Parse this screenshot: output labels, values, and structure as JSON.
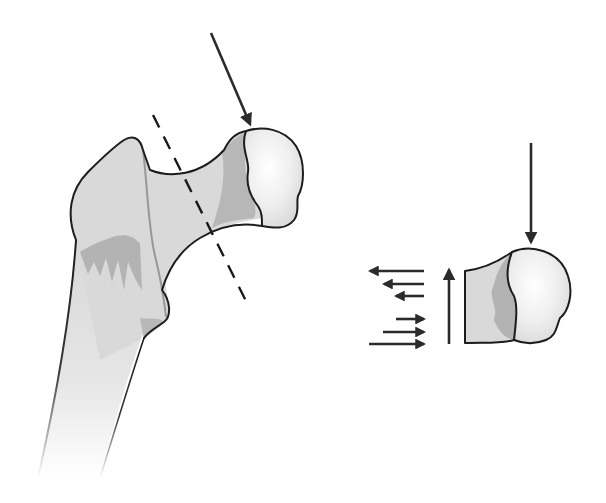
{
  "figure": {
    "title": "",
    "colors": {
      "background": "#ffffff",
      "outline": "#1c1c1c",
      "arrow": "#2b2b2b",
      "bone_light": "#e2e2e2",
      "bone_mid": "#c8c8c8",
      "bone_dark": "#a9a9a9",
      "head_light": "#f4f4f4"
    },
    "left_panel": {
      "elements": [
        {
          "name": "proximal-femur",
          "type": "bone-illustration"
        },
        {
          "name": "femoral-head",
          "type": "sphere"
        },
        {
          "name": "load-arrow",
          "type": "arrow",
          "direction": "down-right"
        },
        {
          "name": "fracture-plane",
          "type": "dashed-line"
        }
      ]
    },
    "right_panel": {
      "elements": [
        {
          "name": "femoral-neck-section",
          "type": "cross-section"
        },
        {
          "name": "vertical-load-arrow",
          "type": "arrow",
          "direction": "down"
        },
        {
          "name": "upward-shear-arrow",
          "type": "arrow",
          "direction": "up"
        },
        {
          "name": "tension-arrows",
          "type": "arrow-group",
          "direction": "left",
          "count": 3
        },
        {
          "name": "compression-arrows",
          "type": "arrow-group",
          "direction": "right",
          "count": 3
        }
      ]
    }
  }
}
